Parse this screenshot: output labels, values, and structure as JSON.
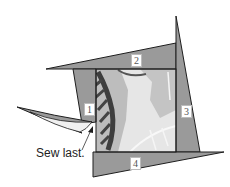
{
  "diagram": {
    "type": "quilt-block-assembly",
    "strips": [
      {
        "id": "strip-1",
        "label": "1"
      },
      {
        "id": "strip-2",
        "label": "2"
      },
      {
        "id": "strip-3",
        "label": "3"
      },
      {
        "id": "strip-4",
        "label": "4"
      }
    ],
    "annotation": "Sew last.",
    "colors": {
      "strip_fill": "#9a9a9a",
      "outline": "#1e1e1e",
      "center_light": "#e6e6e6",
      "center_mid": "#c4c4c4",
      "leaf_dark": "#4a4a4a",
      "flap_light": "#f0f0f0"
    }
  }
}
